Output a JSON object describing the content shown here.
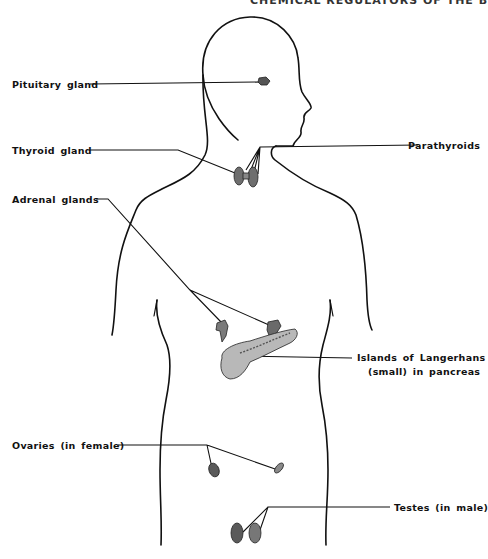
{
  "header": {
    "running_head": "CHEMICAL REGULATORS OF THE BODY 399"
  },
  "figure": {
    "colors": {
      "line": "#111111",
      "gland_fill": "#6e6e6e",
      "pancreas_fill": "#b8b8b8",
      "background": "#ffffff"
    },
    "labels": [
      {
        "id": "pituitary",
        "text": "Pituitary gland"
      },
      {
        "id": "thyroid",
        "text": "Thyroid gland"
      },
      {
        "id": "parathyroids",
        "text": "Parathyroids"
      },
      {
        "id": "adrenal",
        "text": "Adrenal glands"
      },
      {
        "id": "langerhans_line1",
        "text": "Islands of Langerhans"
      },
      {
        "id": "langerhans_line2",
        "text": "(small) in pancreas"
      },
      {
        "id": "ovaries",
        "text": "Ovaries (in female)"
      },
      {
        "id": "testes",
        "text": "Testes (in male)"
      }
    ]
  }
}
